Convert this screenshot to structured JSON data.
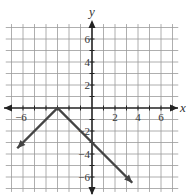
{
  "chart_data": {
    "type": "line",
    "title": "",
    "xlabel": "x",
    "ylabel": "y",
    "xlim": [
      -7.5,
      7.5
    ],
    "ylim": [
      -7,
      7
    ],
    "grid": true,
    "x_ticks": [
      -6,
      2,
      4,
      6
    ],
    "y_ticks": [
      6,
      4,
      2,
      -2,
      -4,
      -6
    ],
    "x_tick_labels": [
      "−6",
      "2",
      "4",
      "6"
    ],
    "y_tick_labels": [
      "6",
      "4",
      "2",
      "−2",
      "−4",
      "−6"
    ],
    "series": [
      {
        "name": "y = -|x + 3|",
        "points": [
          [
            -6.5,
            -3.5
          ],
          [
            -3,
            0
          ],
          [
            0,
            -3
          ],
          [
            3.5,
            -6.5
          ]
        ],
        "arrows_at_ends": true,
        "color": "#444444"
      }
    ],
    "vertex": [
      -3,
      0
    ]
  }
}
